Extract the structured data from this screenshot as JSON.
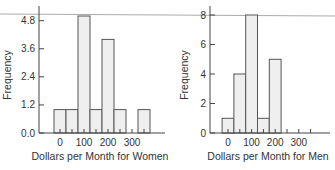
{
  "colors": {
    "bar_fill": "#efefef",
    "bar_stroke": "#555555",
    "axis": "#444444",
    "top_line": "#aaaaaa",
    "text": "#333333"
  },
  "chart_data": [
    {
      "type": "bar",
      "title": "",
      "xlabel": "Dollars per Month for Women",
      "ylabel": "Frequency",
      "ylim": [
        0,
        5
      ],
      "yticks": [
        "0.0",
        "1.2",
        "2.4",
        "3.6",
        "4.8"
      ],
      "ytick_values": [
        0,
        1.2,
        2.4,
        3.6,
        4.8
      ],
      "xticks": [
        "0",
        "100",
        "200",
        "300"
      ],
      "bin_width": 50,
      "bins": [
        -25,
        25,
        75,
        125,
        175,
        225,
        275,
        325
      ],
      "categories": [
        "-25–25",
        "25–75",
        "75–125",
        "125–175",
        "175–225",
        "225–275",
        "275–325",
        "325–375"
      ],
      "values": [
        1,
        1,
        5,
        1,
        4,
        1,
        0,
        1
      ],
      "grid": false
    },
    {
      "type": "bar",
      "title": "",
      "xlabel": "Dollars per Month for Men",
      "ylabel": "Frequency",
      "ylim": [
        0,
        8
      ],
      "yticks": [
        "0",
        "2",
        "4",
        "6",
        "8"
      ],
      "ytick_values": [
        0,
        2,
        4,
        6,
        8
      ],
      "xticks": [
        "0",
        "100",
        "200",
        "300"
      ],
      "bin_width": 50,
      "bins": [
        -25,
        25,
        75,
        125,
        175
      ],
      "categories": [
        "-25–25",
        "25–75",
        "75–125",
        "125–175",
        "175–225"
      ],
      "values": [
        1,
        4,
        8,
        1,
        5
      ],
      "grid": false
    }
  ]
}
